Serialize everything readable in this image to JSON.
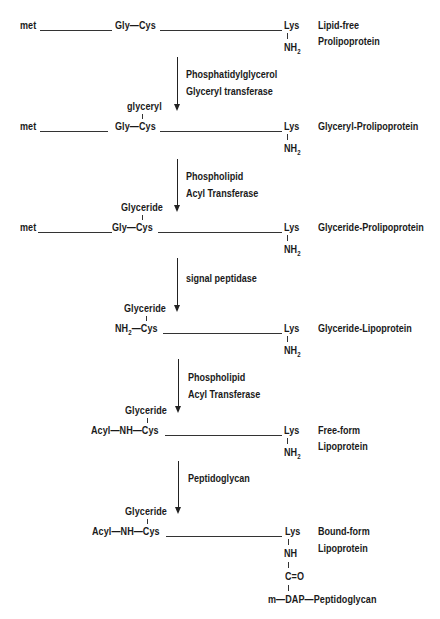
{
  "diagram": {
    "type": "biosynthesis-pathway",
    "stages": [
      {
        "n_terminal": "met",
        "residues": "Gly—Cys",
        "cys_substituent": "",
        "c_terminal": "Lys",
        "side_chain": [
          "NH",
          "2"
        ],
        "name_line1": "Lipid-free",
        "name_line2": "Prolipoprotein"
      },
      {
        "n_terminal": "met",
        "residues": "Gly—Cys",
        "cys_substituent": "glyceryl",
        "c_terminal": "Lys",
        "side_chain": [
          "NH",
          "2"
        ],
        "name_line1": "Glyceryl-Prolipoprotein",
        "name_line2": ""
      },
      {
        "n_terminal": "met",
        "residues": "Gly—Cys",
        "cys_substituent": "Glyceride",
        "c_terminal": "Lys",
        "side_chain": [
          "NH",
          "2"
        ],
        "name_line1": "Glyceride-Prolipoprotein",
        "name_line2": ""
      },
      {
        "n_terminal_prefix": "NH",
        "n_terminal_sub": "2",
        "residues": "—Cys",
        "cys_substituent": "Glyceride",
        "c_terminal": "Lys",
        "side_chain": [
          "NH",
          "2"
        ],
        "name_line1": "Glyceride-Lipoprotein",
        "name_line2": ""
      },
      {
        "residues": "Acyl—NH—Cys",
        "cys_substituent": "Glyceride",
        "c_terminal": "Lys",
        "side_chain": [
          "NH",
          "2"
        ],
        "name_line1": "Free-form",
        "name_line2": "Lipoprotein"
      },
      {
        "residues": "Acyl—NH—Cys",
        "cys_substituent": "Glyceride",
        "c_terminal": "Lys",
        "side_chain_nh": "NH",
        "side_chain_co": "C=O",
        "side_chain_link": "m—DAP—Peptidoglycan",
        "name_line1": "Bound-form",
        "name_line2": "Lipoprotein"
      }
    ],
    "steps": [
      {
        "line1": "Phosphatidylglycerol",
        "line2": "Glyceryl transferase"
      },
      {
        "line1": "Phospholipid",
        "line2": "Acyl Transferase"
      },
      {
        "line1": "signal peptidase",
        "line2": ""
      },
      {
        "line1": "Phospholipid",
        "line2": "Acyl Transferase"
      },
      {
        "line1": "Peptidoglycan",
        "line2": ""
      }
    ]
  }
}
